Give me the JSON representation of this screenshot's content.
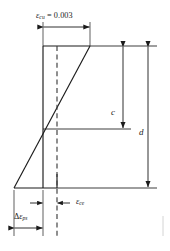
{
  "figure": {
    "kind": "strain-distribution-diagram",
    "background_color": "#ffffff",
    "line_color": "#1a1a1a",
    "dash_color": "#4a4a4a",
    "text_color": "#1a1a1a"
  },
  "labels": {
    "top_strain": {
      "symbol": "ε",
      "subscript": "cu",
      "equals": " = ",
      "value": "0.003",
      "full": "εcu = 0.003"
    },
    "depth_neutral_axis": {
      "symbol": "c",
      "meaning": "depth-to-neutral-axis"
    },
    "effective_depth": {
      "symbol": "d",
      "meaning": "effective-depth"
    },
    "concrete_strain_effective": {
      "symbol": "ε",
      "subscript": "ce",
      "full": "εce"
    },
    "delta_strain_prestress": {
      "delta": "Δ",
      "symbol": "ε",
      "subscript": "ps",
      "full": "Δεps"
    }
  },
  "geometry": {
    "section_top_y": 46,
    "section_bottom_y": 188,
    "neutral_axis_y": 129,
    "rect_left_x": 43,
    "dashed_x": 57,
    "strain_top_right_x": 90,
    "strain_bottom_left_x": 14,
    "right_line_end_x": 157,
    "c_arrow_x": 123,
    "d_arrow_x": 148,
    "top_dim_y": 27,
    "ece_dim_y": 203,
    "deps_dim_y": 228,
    "ext_bottom_y": 236
  }
}
